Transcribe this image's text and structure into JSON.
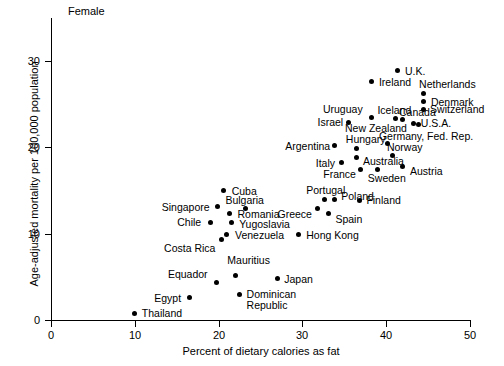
{
  "chart_data": {
    "type": "scatter",
    "title": "Female",
    "xlabel": "Percent of dietary calories as fat",
    "ylabel": "Age-adjusted mortality per 100,000 population",
    "xlim": [
      0,
      50
    ],
    "ylim": [
      0,
      35
    ],
    "xticks": [
      0,
      10,
      20,
      30,
      40,
      50
    ],
    "yticks": [
      0,
      10,
      20,
      30
    ],
    "grid": false,
    "legend": "none",
    "points": [
      {
        "label": "Thailand",
        "x": 10.0,
        "y": 0.8,
        "label_dx": 7,
        "label_dy": -5
      },
      {
        "label": "Egypt",
        "x": 16.5,
        "y": 2.6,
        "label_dx": -35,
        "label_dy": -5
      },
      {
        "label": "Equador",
        "x": 19.8,
        "y": 4.3,
        "label_dx": -49,
        "label_dy": -14
      },
      {
        "label": "Mauritius",
        "x": 22.0,
        "y": 5.1,
        "label_dx": -8,
        "label_dy": -21
      },
      {
        "label": "Dominican\nRepublic",
        "x": 22.5,
        "y": 3.0,
        "label_dx": 7,
        "label_dy": -5
      },
      {
        "label": "Japan",
        "x": 27.0,
        "y": 4.8,
        "label_dx": 7,
        "label_dy": -5
      },
      {
        "label": "Costa Rica",
        "x": 20.3,
        "y": 9.3,
        "label_dx": -57,
        "label_dy": 3
      },
      {
        "label": "Venezuela",
        "x": 21.0,
        "y": 9.9,
        "label_dx": 8,
        "label_dy": -5
      },
      {
        "label": "Chile",
        "x": 19.0,
        "y": 11.3,
        "label_dx": -33,
        "label_dy": -5
      },
      {
        "label": "Yugoslavia",
        "x": 21.5,
        "y": 11.3,
        "label_dx": 8,
        "label_dy": -3
      },
      {
        "label": "Romania",
        "x": 21.3,
        "y": 12.3,
        "label_dx": 8,
        "label_dy": -5
      },
      {
        "label": "Singapore",
        "x": 19.9,
        "y": 13.1,
        "label_dx": -56,
        "label_dy": -5
      },
      {
        "label": "Bulgaria",
        "x": 23.2,
        "y": 12.9,
        "label_dx": -20,
        "label_dy": -14
      },
      {
        "label": "Cuba",
        "x": 20.6,
        "y": 15.0,
        "label_dx": 8,
        "label_dy": -5
      },
      {
        "label": "Hong Kong",
        "x": 29.5,
        "y": 9.9,
        "label_dx": 8,
        "label_dy": -5
      },
      {
        "label": "Greece",
        "x": 31.8,
        "y": 12.9,
        "label_dx": -40,
        "label_dy": 0
      },
      {
        "label": "Spain",
        "x": 33.1,
        "y": 12.4,
        "label_dx": 7,
        "label_dy": 1
      },
      {
        "label": "Portugal",
        "x": 32.6,
        "y": 14.0,
        "label_dx": -18,
        "label_dy": -14
      },
      {
        "label": "Poland",
        "x": 33.8,
        "y": 14.0,
        "label_dx": 7,
        "label_dy": -8
      },
      {
        "label": "Finland",
        "x": 36.8,
        "y": 13.9,
        "label_dx": 7,
        "label_dy": -5
      },
      {
        "label": "Italy",
        "x": 34.7,
        "y": 18.2,
        "label_dx": -26,
        "label_dy": -5
      },
      {
        "label": "Argentina",
        "x": 33.8,
        "y": 20.2,
        "label_dx": -49,
        "label_dy": -5
      },
      {
        "label": "France",
        "x": 36.9,
        "y": 17.5,
        "label_dx": -37,
        "label_dy": 0
      },
      {
        "label": "Sweden",
        "x": 39.0,
        "y": 17.5,
        "label_dx": -10,
        "label_dy": 4
      },
      {
        "label": "Australia",
        "x": 36.4,
        "y": 18.8,
        "label_dx": 7,
        "label_dy": -2
      },
      {
        "label": "Hungary",
        "x": 36.5,
        "y": 19.9,
        "label_dx": -11,
        "label_dy": -14
      },
      {
        "label": "Austria",
        "x": 42.0,
        "y": 17.8,
        "label_dx": 7,
        "label_dy": 0
      },
      {
        "label": "Norway",
        "x": 40.8,
        "y": 19.1,
        "label_dx": -6,
        "label_dy": -13
      },
      {
        "label": "Germany, Fed. Rep.",
        "x": 40.2,
        "y": 20.4,
        "label_dx": -9,
        "label_dy": -13
      },
      {
        "label": "Israel",
        "x": 35.5,
        "y": 22.9,
        "label_dx": -31,
        "label_dy": -5
      },
      {
        "label": "New Zealand",
        "x": 43.8,
        "y": 22.6,
        "label_dx": -73,
        "label_dy": -2
      },
      {
        "label": "U.S.A.",
        "x": 43.3,
        "y": 22.8,
        "label_dx": 7,
        "label_dy": -5
      },
      {
        "label": "Canada",
        "x": 42.0,
        "y": 23.2,
        "label_dx": -4,
        "label_dy": -13
      },
      {
        "label": "Uruguay",
        "x": 38.3,
        "y": 23.5,
        "label_dx": -49,
        "label_dy": -13
      },
      {
        "label": "Iceland",
        "x": 41.1,
        "y": 23.3,
        "label_dx": -18,
        "label_dy": -14
      },
      {
        "label": "Switzerland",
        "x": 44.4,
        "y": 24.4,
        "label_dx": 7,
        "label_dy": -5
      },
      {
        "label": "Denmark",
        "x": 44.5,
        "y": 25.3,
        "label_dx": 7,
        "label_dy": -5
      },
      {
        "label": "Netherlands",
        "x": 44.4,
        "y": 26.3,
        "label_dx": -4,
        "label_dy": -14
      },
      {
        "label": "Ireland",
        "x": 38.3,
        "y": 27.6,
        "label_dx": 7,
        "label_dy": -5
      },
      {
        "label": "U.K.",
        "x": 41.4,
        "y": 28.9,
        "label_dx": 7,
        "label_dy": -5
      }
    ]
  }
}
